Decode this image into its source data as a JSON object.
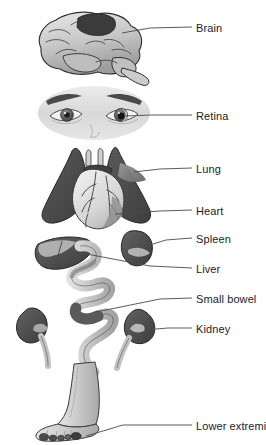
{
  "figure": {
    "type": "anatomical-diagram",
    "title": "",
    "style": "grayscale medical illustration with leader lines",
    "background_color": "#ffffff",
    "label_color": "#1c1c1c",
    "leader_line_color": "#4a4a4a",
    "organ_dark": "#4d4d4d",
    "organ_mid": "#8a8a8a",
    "organ_light": "#c9c9c9",
    "organ_pale": "#e2e2e2",
    "outline": "#2b2b2b"
  },
  "labels": [
    {
      "id": "brain",
      "text": "Brain",
      "x": 196,
      "y": 22,
      "line_x1": 155,
      "line_y1": 27,
      "line_x2": 192,
      "line_y2": 27
    },
    {
      "id": "retina",
      "text": "Retina",
      "x": 196,
      "y": 110,
      "line_x1": 155,
      "line_y1": 115,
      "line_x2": 192,
      "line_y2": 115
    },
    {
      "id": "lung",
      "text": "Lung",
      "x": 196,
      "y": 163,
      "line_x1": 155,
      "line_y1": 168,
      "line_x2": 192,
      "line_y2": 168
    },
    {
      "id": "heart",
      "text": "Heart",
      "x": 196,
      "y": 205,
      "line_x1": 155,
      "line_y1": 210,
      "line_x2": 192,
      "line_y2": 210
    },
    {
      "id": "spleen",
      "text": "Spleen",
      "x": 196,
      "y": 233,
      "line_x1": 155,
      "line_y1": 238,
      "line_x2": 192,
      "line_y2": 238
    },
    {
      "id": "liver",
      "text": "Liver",
      "x": 196,
      "y": 263,
      "line_x1": 155,
      "line_y1": 268,
      "line_x2": 192,
      "line_y2": 268
    },
    {
      "id": "small-bowel",
      "text": "Small bowel",
      "x": 196,
      "y": 293,
      "line_x1": 155,
      "line_y1": 298,
      "line_x2": 192,
      "line_y2": 298
    },
    {
      "id": "kidney",
      "text": "Kidney",
      "x": 196,
      "y": 323,
      "line_x1": 155,
      "line_y1": 328,
      "line_x2": 192,
      "line_y2": 328
    },
    {
      "id": "lower-extremity",
      "text": "Lower extremity",
      "x": 196,
      "y": 420,
      "line_x1": 123,
      "line_y1": 425,
      "line_x2": 192,
      "line_y2": 425
    }
  ],
  "organs": [
    {
      "id": "brain",
      "name": "Brain",
      "view": "lateral",
      "highlight": "dark parietal region"
    },
    {
      "id": "retina",
      "name": "Retina",
      "view": "frontal face with both eyes",
      "highlight": "dark pupil / retina"
    },
    {
      "id": "lung",
      "name": "Lung",
      "view": "anterior pair",
      "highlight": "right lung shading"
    },
    {
      "id": "heart",
      "name": "Heart",
      "view": "anterior with coronary vessels",
      "highlight": "pale myocardium"
    },
    {
      "id": "spleen",
      "name": "Spleen",
      "view": "lateral bean",
      "highlight": "hilum wedge"
    },
    {
      "id": "liver",
      "name": "Liver",
      "view": "inferior wedge",
      "highlight": "cut surface"
    },
    {
      "id": "small-bowel",
      "name": "Small bowel",
      "view": "coiled loops",
      "highlight": "mid loop segment"
    },
    {
      "id": "kidney",
      "name": "Kidney",
      "view": "pair with ureters",
      "highlight": "hilum"
    },
    {
      "id": "lower-extremity",
      "name": "Lower extremity",
      "view": "foot and lower leg",
      "highlight": "toes"
    }
  ]
}
